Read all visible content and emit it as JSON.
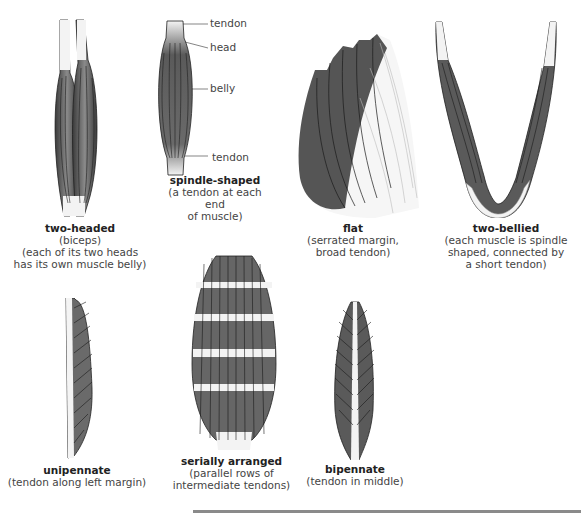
{
  "figures": [
    {
      "id": "two-headed",
      "title": "two-headed",
      "lines": [
        "(biceps)",
        "(each of its two heads",
        "has its own muscle belly)"
      ]
    },
    {
      "id": "spindle-shaped",
      "title": "spindle-shaped",
      "lines": [
        "(a tendon at each end",
        "of muscle)"
      ],
      "labels": {
        "tendon_top": "tendon",
        "head": "head",
        "belly": "belly",
        "tendon_bottom": "tendon"
      }
    },
    {
      "id": "flat",
      "title": "flat",
      "lines": [
        "(serrated margin,",
        "broad tendon)"
      ]
    },
    {
      "id": "two-bellied",
      "title": "two-bellied",
      "lines": [
        "(each muscle is spindle",
        "shaped, connected by",
        "a short tendon)"
      ]
    },
    {
      "id": "unipennate",
      "title": "unipennate",
      "lines": [
        "(tendon along left margin)"
      ]
    },
    {
      "id": "serially-arranged",
      "title": "serially arranged",
      "lines": [
        "(parallel rows of",
        "intermediate tendons)"
      ]
    },
    {
      "id": "bipennate",
      "title": "bipennate",
      "lines": [
        "(tendon in middle)"
      ]
    }
  ],
  "colors": {
    "muscle_dark": "#3d3d3d",
    "muscle_mid": "#7a7a7a",
    "tendon": "#f2f2f2",
    "rule": "#8a8a8a"
  }
}
